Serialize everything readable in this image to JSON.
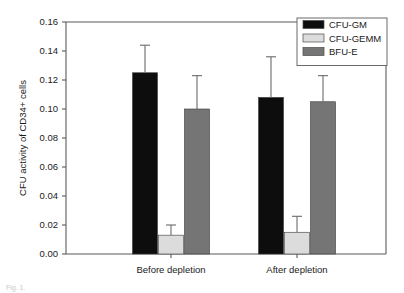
{
  "chart_data": {
    "type": "bar",
    "title": "",
    "xlabel": "",
    "ylabel": "CFU activity of CD34+ cells",
    "categories": [
      "Before depletion",
      "After depletion"
    ],
    "ylim": [
      0.0,
      0.16
    ],
    "ytick_step": 0.02,
    "ytick_labels": [
      "0.00",
      "0.02",
      "0.04",
      "0.06",
      "0.08",
      "0.10",
      "0.12",
      "0.14",
      "0.16"
    ],
    "ytick_values": [
      0.0,
      0.02,
      0.04,
      0.06,
      0.08,
      0.1,
      0.12,
      0.14,
      0.16
    ],
    "grid": false,
    "legend_position": "top-right",
    "error_bars": "upper-only",
    "series": [
      {
        "name": "CFU-GM",
        "color": "#0d0d0d",
        "values": [
          0.125,
          0.108
        ],
        "errors_upper": [
          0.144,
          0.136
        ]
      },
      {
        "name": "CFU-GEMM",
        "color": "#dcdcdc",
        "values": [
          0.013,
          0.015
        ],
        "errors_upper": [
          0.02,
          0.026
        ]
      },
      {
        "name": "BFU-E",
        "color": "#757575",
        "values": [
          0.1,
          0.105
        ],
        "errors_upper": [
          0.123,
          0.123
        ]
      }
    ]
  },
  "legend": {
    "items": [
      {
        "label": "CFU-GM",
        "color": "#0d0d0d"
      },
      {
        "label": "CFU-GEMM",
        "color": "#dcdcdc"
      },
      {
        "label": "BFU-E",
        "color": "#757575"
      }
    ]
  },
  "caption": {
    "text": "Fig. 1."
  }
}
